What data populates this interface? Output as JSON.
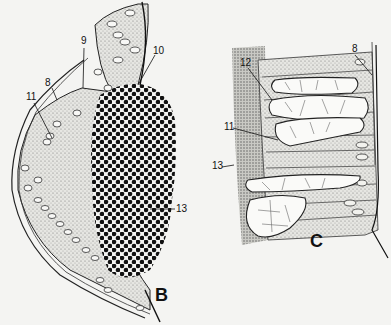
{
  "figure": {
    "background": "#f4f4f2",
    "ink": "#111111",
    "panels": [
      {
        "id": "B",
        "label": "B",
        "callouts": [
          {
            "num": "8",
            "x": 45,
            "y": 78
          },
          {
            "num": "9",
            "x": 81,
            "y": 37
          },
          {
            "num": "10",
            "x": 153,
            "y": 48
          },
          {
            "num": "11",
            "x": 27,
            "y": 93
          },
          {
            "num": "13",
            "x": 177,
            "y": 209
          }
        ]
      },
      {
        "id": "C",
        "label": "C",
        "callouts": [
          {
            "num": "8",
            "x": 352,
            "y": 45
          },
          {
            "num": "11",
            "x": 225,
            "y": 124
          },
          {
            "num": "12",
            "x": 240,
            "y": 59
          },
          {
            "num": "13",
            "x": 214,
            "y": 163
          }
        ]
      }
    ]
  }
}
